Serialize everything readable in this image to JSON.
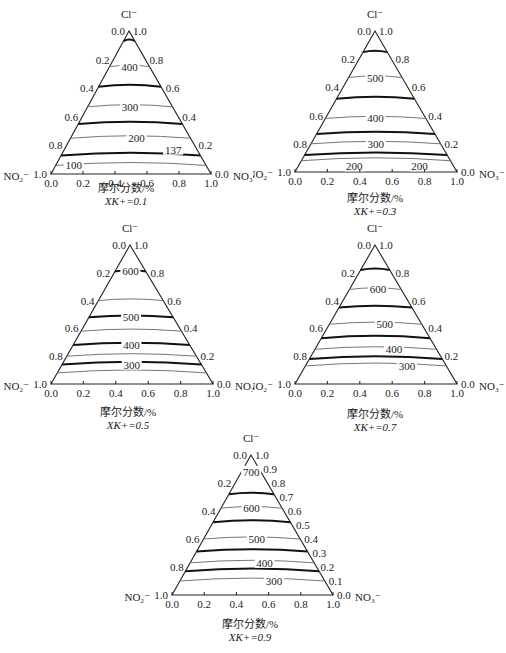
{
  "chart_data": [
    {
      "type": "ternary-contour",
      "title": "X_K+ = 0.1",
      "caption_xlabel": "摩尔分数/%",
      "caption_condition": "XK+=0.1",
      "apex_labels": {
        "top": "Cl⁻",
        "left": "NO₂⁻",
        "right": "NO₃⁻"
      },
      "bottom_ticks": [
        "0.0",
        "0.2",
        "0.4",
        "0.6",
        "0.8",
        "1.0"
      ],
      "left_ticks": [
        "0.0",
        "0.2",
        "0.4",
        "0.6",
        "0.8",
        "1.0"
      ],
      "right_ticks": [
        "1.0",
        "0.8",
        "0.6",
        "0.4",
        "0.2",
        "0.0"
      ],
      "contour_labels": [
        {
          "value": "400",
          "cl": 0.75,
          "pos": 0.5
        },
        {
          "value": "300",
          "cl": 0.47,
          "pos": 0.5
        },
        {
          "value": "200",
          "cl": 0.25,
          "pos": 0.55
        },
        {
          "value": "137",
          "cl": 0.17,
          "pos": 0.82
        },
        {
          "value": "100",
          "cl": 0.06,
          "pos": 0.12
        }
      ],
      "contour_levels_cl": [
        0.93,
        0.75,
        0.61,
        0.47,
        0.35,
        0.25,
        0.13,
        0.06
      ]
    },
    {
      "type": "ternary-contour",
      "title": "X_K+ = 0.3",
      "caption_xlabel": "摩尔分数/%",
      "caption_condition": "XK+=0.3",
      "apex_labels": {
        "top": "Cl⁻",
        "left": "NO₂⁻",
        "right": "NO₃⁻"
      },
      "bottom_ticks": [
        "0.0",
        "0.2",
        "0.4",
        "0.6",
        "0.8",
        "1.0"
      ],
      "left_ticks": [
        "0.0",
        "0.2",
        "0.4",
        "0.6",
        "0.8",
        "1.0"
      ],
      "right_ticks": [
        "1.0",
        "0.8",
        "0.6",
        "0.4",
        "0.2",
        "0.0"
      ],
      "contour_labels": [
        {
          "value": "500",
          "cl": 0.67,
          "pos": 0.5
        },
        {
          "value": "400",
          "cl": 0.38,
          "pos": 0.5
        },
        {
          "value": "300",
          "cl": 0.2,
          "pos": 0.5
        },
        {
          "value": "200",
          "cl": 0.04,
          "pos": 0.36
        },
        {
          "value": "200",
          "cl": 0.04,
          "pos": 0.78
        }
      ],
      "contour_levels_cl": [
        0.85,
        0.67,
        0.52,
        0.38,
        0.27,
        0.2,
        0.12,
        0.08
      ]
    },
    {
      "type": "ternary-contour",
      "title": "X_K+ = 0.5",
      "caption_xlabel": "摩尔分数/%",
      "caption_condition": "XK+=0.5",
      "apex_labels": {
        "top": "Cl⁻",
        "left": "NO₂⁻",
        "right": "NO₃⁻"
      },
      "bottom_ticks": [
        "0.0",
        "0.2",
        "0.4",
        "0.6",
        "0.8",
        "1.0"
      ],
      "left_ticks": [
        "0.0",
        "0.2",
        "0.4",
        "0.6",
        "0.8",
        "1.0"
      ],
      "right_ticks": [
        "1.0",
        "0.8",
        "0.6",
        "0.4",
        "0.2",
        "0.0"
      ],
      "contour_labels": [
        {
          "value": "600",
          "cl": 0.81,
          "pos": 0.5
        },
        {
          "value": "500",
          "cl": 0.48,
          "pos": 0.5
        },
        {
          "value": "400",
          "cl": 0.28,
          "pos": 0.5
        },
        {
          "value": "300",
          "cl": 0.14,
          "pos": 0.5
        }
      ],
      "contour_levels_cl": [
        0.81,
        0.6,
        0.48,
        0.38,
        0.28,
        0.2,
        0.14,
        0.08
      ]
    },
    {
      "type": "ternary-contour",
      "title": "X_K+ = 0.7",
      "caption_xlabel": "摩尔分数/%",
      "caption_condition": "XK+=0.7",
      "apex_labels": {
        "top": "Cl⁻",
        "left": "NO₂⁻",
        "right": "NO₃⁻"
      },
      "bottom_ticks": [
        "0.0",
        "0.2",
        "0.4",
        "0.6",
        "0.8",
        "1.0"
      ],
      "left_ticks": [
        "0.0",
        "0.2",
        "0.4",
        "0.6",
        "0.8",
        "1.0"
      ],
      "right_ticks": [
        "1.0",
        "0.8",
        "0.6",
        "0.4",
        "0.2",
        "0.0"
      ],
      "contour_labels": [
        {
          "value": "600",
          "cl": 0.68,
          "pos": 0.55
        },
        {
          "value": "500",
          "cl": 0.43,
          "pos": 0.6
        },
        {
          "value": "400",
          "cl": 0.25,
          "pos": 0.65
        },
        {
          "value": "300",
          "cl": 0.13,
          "pos": 0.72
        }
      ],
      "contour_levels_cl": [
        0.82,
        0.68,
        0.55,
        0.43,
        0.33,
        0.25,
        0.18,
        0.13
      ]
    },
    {
      "type": "ternary-contour",
      "title": "X_K+ = 0.9",
      "caption_xlabel": "摩尔分数/%",
      "caption_condition": "XK+=0.9",
      "apex_labels": {
        "top": "Cl⁻",
        "left": "NO₂⁻",
        "right": "NO₃⁻"
      },
      "bottom_ticks": [
        "0.0",
        "0.2",
        "0.4",
        "0.6",
        "0.8",
        "1.0"
      ],
      "left_ticks": [
        "0.0",
        "0.2",
        "0.4",
        "0.6",
        "0.8",
        "1.0"
      ],
      "right_ticks": [
        "1.0",
        "0.9",
        "0.8",
        "0.7",
        "0.6",
        "0.5",
        "0.4",
        "0.3",
        "0.2",
        "0.1",
        "0.0"
      ],
      "contour_labels": [
        {
          "value": "700",
          "cl": 0.88,
          "pos": 0.5
        },
        {
          "value": "600",
          "cl": 0.62,
          "pos": 0.5
        },
        {
          "value": "500",
          "cl": 0.4,
          "pos": 0.55
        },
        {
          "value": "400",
          "cl": 0.23,
          "pos": 0.6
        },
        {
          "value": "300",
          "cl": 0.1,
          "pos": 0.65
        }
      ],
      "contour_levels_cl": [
        0.72,
        0.62,
        0.52,
        0.4,
        0.31,
        0.23,
        0.17,
        0.1
      ]
    }
  ],
  "panels": [
    {
      "caption_xlabel": "摩尔分数/%",
      "caption_condition": "XK+=0.1"
    },
    {
      "caption_xlabel": "摩尔分数/%",
      "caption_condition": "XK+=0.3"
    },
    {
      "caption_xlabel": "摩尔分数/%",
      "caption_condition": "XK+=0.5"
    },
    {
      "caption_xlabel": "摩尔分数/%",
      "caption_condition": "XK+=0.7"
    },
    {
      "caption_xlabel": "摩尔分数/%",
      "caption_condition": "XK+=0.9"
    }
  ]
}
